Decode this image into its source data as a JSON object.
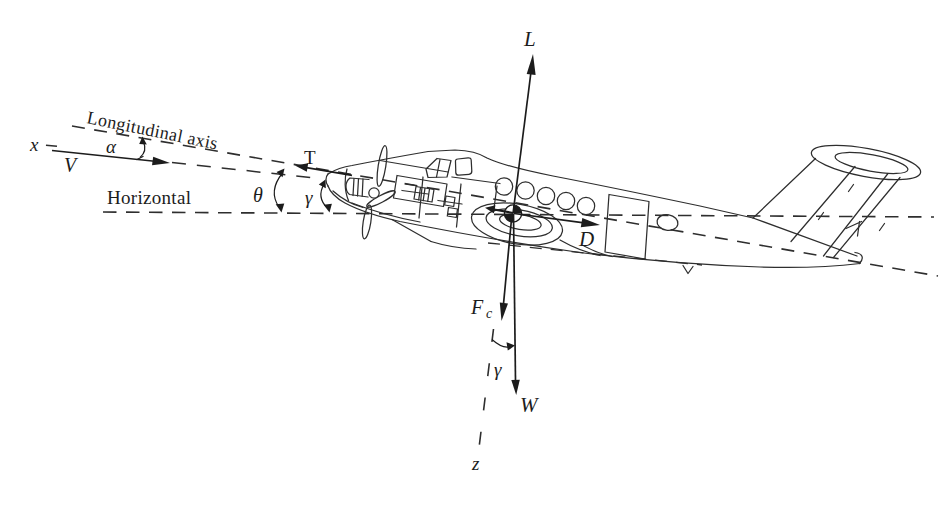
{
  "colors": {
    "ink": "#1c1c1c",
    "line": "#2e2e2e",
    "background": "#ffffff"
  },
  "labels": {
    "longitudinal_axis": "Longitudinal axis",
    "horizontal": "Horizontal",
    "x_axis": "x",
    "velocity": "V",
    "alpha": "α",
    "theta": "θ",
    "gamma_flight_path": "γ",
    "thrust": "T",
    "lift": "L",
    "drag": "D",
    "centrifugal_force_symbol": "F",
    "centrifugal_force_subscript": "c",
    "gamma_weight": "γ",
    "weight": "W",
    "z_axis": "z"
  }
}
